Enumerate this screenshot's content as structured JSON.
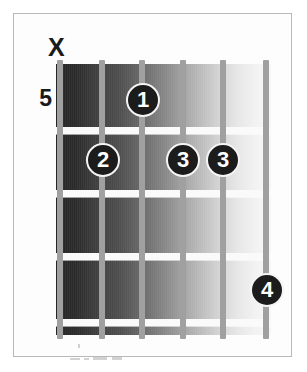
{
  "diagram": {
    "type": "guitar-chord-chart",
    "start_fret_label": "5",
    "mute_marker": "X",
    "muted_string_index": 1,
    "string_count": 6,
    "fret_count": 4,
    "fingerings": [
      {
        "finger": "1",
        "string": 3,
        "fret": 1,
        "x": 143,
        "y": 100
      },
      {
        "finger": "2",
        "string": 2,
        "fret": 2,
        "x": 103,
        "y": 160
      },
      {
        "finger": "3",
        "string": 4,
        "fret": 2,
        "x": 183,
        "y": 160
      },
      {
        "finger": "3",
        "string": 5,
        "fret": 2,
        "x": 223,
        "y": 160
      },
      {
        "finger": "4",
        "string": 6,
        "fret": 4,
        "x": 267,
        "y": 290
      }
    ],
    "strings_x": [
      60,
      102,
      142,
      183,
      223,
      266
    ],
    "frets_y": [
      127,
      190,
      253,
      319
    ],
    "colors": {
      "dot_fill": "#1c1c1c",
      "dot_ring": "#f4f4f4",
      "dot_text": "#ffffff",
      "string": "#a0a0a0",
      "fret_line": "#fafafa",
      "board_dark": "#262626",
      "board_light": "#f7f7f7",
      "frame": "#b9b9b9",
      "label_text": "#1a1a1a",
      "background": "#ffffff"
    }
  },
  "artifacts": [
    {
      "x": 78,
      "y": 344,
      "w": 2,
      "h": 4
    },
    {
      "x": 70,
      "y": 358,
      "w": 10,
      "h": 2
    },
    {
      "x": 84,
      "y": 358,
      "w": 5,
      "h": 2
    },
    {
      "x": 93,
      "y": 357,
      "w": 14,
      "h": 3
    },
    {
      "x": 112,
      "y": 357,
      "w": 10,
      "h": 3
    }
  ]
}
